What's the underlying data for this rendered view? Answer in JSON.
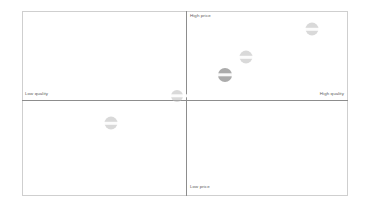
{
  "chart_data": {
    "type": "scatter",
    "title": "",
    "subtitle": "",
    "xlabel": "Quality",
    "ylabel": "Price",
    "xlim": [
      -1,
      1
    ],
    "ylim": [
      -1,
      1
    ],
    "grid": false,
    "legend": "none",
    "axis_labels": {
      "top": "High price",
      "bottom": "Low price",
      "left": "Low quality",
      "right": "High quality"
    },
    "quadrants": [
      {
        "name": "low-quality-high-price",
        "position": "top-left"
      },
      {
        "name": "high-quality-high-price",
        "position": "top-right"
      },
      {
        "name": "low-quality-low-price",
        "position": "bottom-left"
      },
      {
        "name": "high-quality-low-price",
        "position": "bottom-right"
      }
    ],
    "points": [
      {
        "label": "",
        "x": 0.78,
        "y": 0.81,
        "size": 13,
        "emphasis": false
      },
      {
        "label": "",
        "x": 0.37,
        "y": 0.49,
        "size": 13,
        "emphasis": false
      },
      {
        "label": "",
        "x": 0.24,
        "y": 0.29,
        "size": 14,
        "emphasis": true
      },
      {
        "label": "",
        "x": -0.06,
        "y": 0.05,
        "size": 12,
        "emphasis": false
      },
      {
        "label": "",
        "x": -0.47,
        "y": -0.26,
        "size": 13,
        "emphasis": false
      }
    ]
  }
}
